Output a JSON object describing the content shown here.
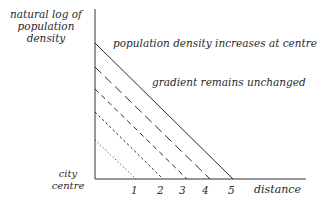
{
  "diagram": {
    "y_axis_label": [
      "natural log of",
      "population",
      "density"
    ],
    "x_axis_label": "distance",
    "origin_label": [
      "city",
      "centre"
    ],
    "annotations": [
      "population density increases at centre",
      "gradient remains unchanged"
    ],
    "x_ticks": [
      "1",
      "2",
      "3",
      "4",
      "5"
    ],
    "lines": [
      {
        "style": "dotted",
        "x_intercept": 1
      },
      {
        "style": "short-dash",
        "x_intercept": 2
      },
      {
        "style": "medium-dash",
        "x_intercept": 3
      },
      {
        "style": "long-dash",
        "x_intercept": 4
      },
      {
        "style": "solid",
        "x_intercept": 5
      }
    ],
    "line_color": "#2a2a2a"
  }
}
